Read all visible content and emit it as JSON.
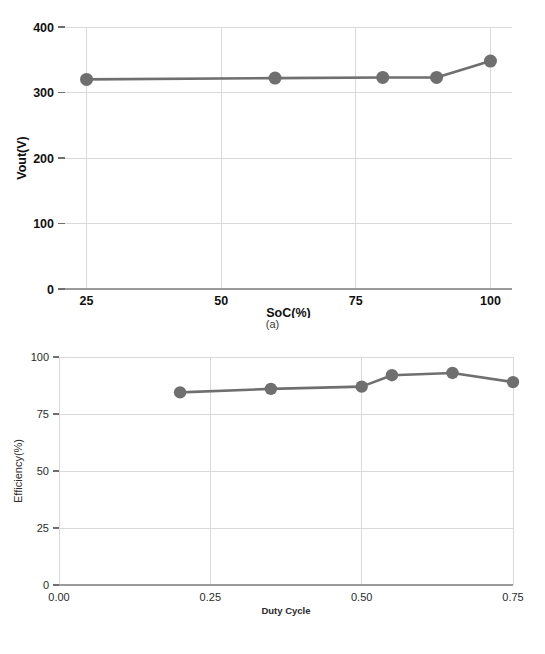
{
  "figure": {
    "panel_a_caption": "(a)",
    "panel_b_caption": "(b)"
  },
  "colors": {
    "series": "#6f6f6f",
    "grid": "#d9d9d9",
    "axis": "#9a9a9a",
    "text": "#111111",
    "background": "#ffffff"
  },
  "chart_data": [
    {
      "id": "panel-a",
      "type": "line",
      "title": "",
      "caption": "(a)",
      "xlabel": "SoC(%)",
      "ylabel": "Vout(V)",
      "xlim": [
        21,
        104
      ],
      "ylim": [
        0,
        400
      ],
      "xticks": [
        25,
        50,
        75,
        100
      ],
      "xticklabels": [
        "25",
        "50",
        "75",
        "100"
      ],
      "yticks": [
        0,
        100,
        200,
        300,
        400
      ],
      "yticklabels": [
        "0",
        "100",
        "200",
        "300",
        "400"
      ],
      "grid": true,
      "legend": "none",
      "x": [
        25,
        60,
        80,
        90,
        100
      ],
      "values": [
        320,
        322,
        323,
        323,
        348
      ],
      "series": [
        {
          "name": "Vout",
          "x": [
            25,
            60,
            80,
            90,
            100
          ],
          "values": [
            320,
            322,
            323,
            323,
            348
          ]
        }
      ]
    },
    {
      "id": "panel-b",
      "type": "line",
      "title": "",
      "caption": "(b)",
      "xlabel": "Duty Cycle",
      "ylabel": "Efficiency(%)",
      "xlim": [
        0.0,
        0.75
      ],
      "ylim": [
        0,
        100
      ],
      "xticks": [
        0.0,
        0.25,
        0.5,
        0.75
      ],
      "xticklabels": [
        "0.00",
        "0.25",
        "0.50",
        "0.75"
      ],
      "yticks": [
        0,
        25,
        50,
        75,
        100
      ],
      "yticklabels": [
        "0",
        "25",
        "50",
        "75",
        "100"
      ],
      "grid": true,
      "legend": "none",
      "x": [
        0.2,
        0.35,
        0.5,
        0.55,
        0.65,
        0.75
      ],
      "values": [
        84.5,
        86,
        87,
        92,
        93,
        89
      ],
      "series": [
        {
          "name": "Efficiency",
          "x": [
            0.2,
            0.35,
            0.5,
            0.55,
            0.65,
            0.75
          ],
          "values": [
            84.5,
            86,
            87,
            92,
            93,
            89
          ]
        }
      ]
    }
  ]
}
